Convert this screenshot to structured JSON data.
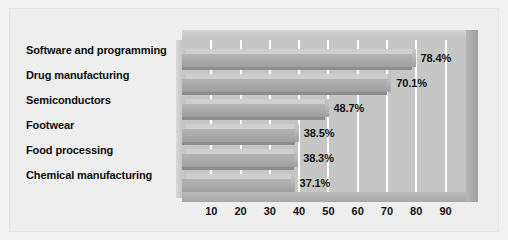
{
  "chart_data": {
    "type": "bar",
    "orientation": "horizontal",
    "title": "",
    "subtitle": "",
    "xlabel": "",
    "ylabel": "",
    "xlim": [
      0,
      97
    ],
    "xticks": [
      "10",
      "20",
      "30",
      "40",
      "50",
      "60",
      "70",
      "80",
      "90"
    ],
    "xtick_values": [
      10,
      20,
      30,
      40,
      50,
      60,
      70,
      80,
      90
    ],
    "grid": true,
    "legend": false,
    "value_suffix": "%",
    "categories": [
      "Software and programming",
      "Drug manufacturing",
      "Semiconductors",
      "Footwear",
      "Food processing",
      "Chemical manufacturing"
    ],
    "values": [
      78.4,
      70.1,
      48.7,
      38.5,
      38.3,
      37.1
    ],
    "value_labels": [
      "78.4%",
      "70.1%",
      "48.7%",
      "38.5%",
      "38.3%",
      "37.1%"
    ],
    "colors": {
      "bar_face": "#a9a9a9",
      "bar_top": "#cfcfcf",
      "plot_background": "#c6c6c6",
      "figure_background": "#eeeeee",
      "gridline": "#ffffff",
      "text": "#111111"
    }
  }
}
